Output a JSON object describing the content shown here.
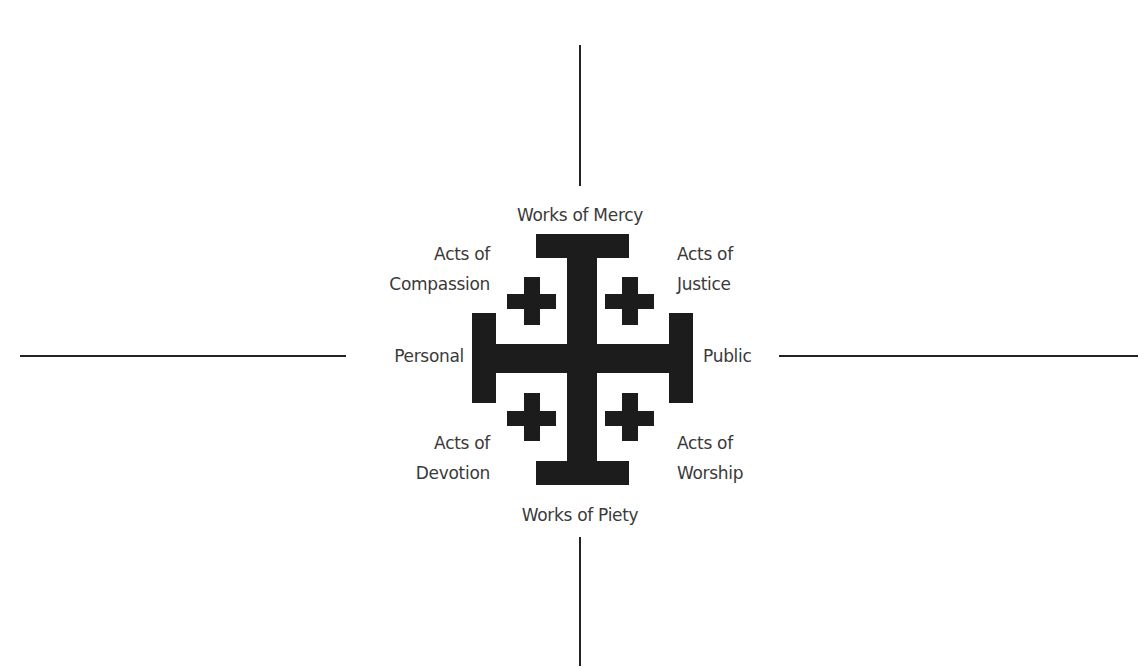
{
  "diagram": {
    "type": "quadrant-axes-with-jerusalem-cross",
    "axes": {
      "vertical_top": {
        "x": 580,
        "y1": 45,
        "y2": 186
      },
      "vertical_bottom": {
        "x": 580,
        "y1": 537,
        "y2": 666
      },
      "horizontal_left": {
        "y": 356,
        "x1": 20,
        "x2": 346
      },
      "horizontal_right": {
        "y": 356,
        "x1": 779,
        "x2": 1138
      }
    },
    "poles": {
      "top": "Works of Mercy",
      "bottom": "Works of Piety",
      "left": "Personal",
      "right": "Public"
    },
    "quadrants": {
      "top_left": {
        "line1": "Acts of",
        "line2": "Compassion"
      },
      "top_right": {
        "line1": "Acts of",
        "line2": "Justice"
      },
      "bottom_left": {
        "line1": "Acts of",
        "line2": "Devotion"
      },
      "bottom_right": {
        "line1": "Acts of",
        "line2": "Worship"
      }
    },
    "symbol": "jerusalem-cross-icon",
    "colors": {
      "symbol": "#1c1c1c",
      "text": "#3a3a3a",
      "axis": "#222222",
      "background": "#ffffff"
    }
  }
}
